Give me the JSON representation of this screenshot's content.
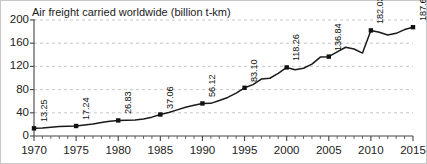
{
  "chart_data": {
    "type": "line",
    "title": "Air freight carried worldwide (billion t-km)",
    "xlabel": "",
    "ylabel": "",
    "xlim": [
      1970,
      2015
    ],
    "ylim": [
      0,
      200
    ],
    "grid": true,
    "legend": null,
    "y_ticks": [
      0,
      40,
      80,
      120,
      160,
      200
    ],
    "x_ticks": [
      1970,
      1975,
      1980,
      1985,
      1990,
      1995,
      2000,
      2005,
      2010,
      2015
    ],
    "x_minor_tick_step": 1,
    "series": [
      {
        "name": "Air freight carried worldwide",
        "color": "#1a1a1a",
        "x": [
          1970,
          1971,
          1972,
          1973,
          1974,
          1975,
          1976,
          1977,
          1978,
          1979,
          1980,
          1981,
          1982,
          1983,
          1984,
          1985,
          1986,
          1987,
          1988,
          1989,
          1990,
          1991,
          1992,
          1993,
          1994,
          1995,
          1996,
          1997,
          1998,
          1999,
          2000,
          2001,
          2002,
          2003,
          2004,
          2005,
          2006,
          2007,
          2008,
          2009,
          2010,
          2011,
          2012,
          2013,
          2014,
          2015
        ],
        "values": [
          13.25,
          13.9,
          15.1,
          16.4,
          16.8,
          17.24,
          19.0,
          20.6,
          23.2,
          25.6,
          26.83,
          27.1,
          27.6,
          29.2,
          32.5,
          37.06,
          40.5,
          45.1,
          49.6,
          53.0,
          56.12,
          56.3,
          61.2,
          66.5,
          74.0,
          83.1,
          88.5,
          98.2,
          99.6,
          108.0,
          118.26,
          114.2,
          116.8,
          124.0,
          136.0,
          136.84,
          145.0,
          153.0,
          150.0,
          143.0,
          182.03,
          179.0,
          174.0,
          177.0,
          183.5,
          187.62
        ]
      }
    ],
    "labeled_points": [
      {
        "x": 1970,
        "y": 13.25,
        "label": "13.25"
      },
      {
        "x": 1975,
        "y": 17.24,
        "label": "17.24"
      },
      {
        "x": 1980,
        "y": 26.83,
        "label": "26.83"
      },
      {
        "x": 1985,
        "y": 37.06,
        "label": "37.06"
      },
      {
        "x": 1990,
        "y": 56.12,
        "label": "56.12"
      },
      {
        "x": 1995,
        "y": 83.1,
        "label": "83.10"
      },
      {
        "x": 2000,
        "y": 118.26,
        "label": "118.26"
      },
      {
        "x": 2005,
        "y": 136.84,
        "label": "136.84"
      },
      {
        "x": 2010,
        "y": 182.03,
        "label": "182.03"
      },
      {
        "x": 2015,
        "y": 187.62,
        "label": "187.62"
      }
    ],
    "colors": {
      "line": "#1a1a1a",
      "marker": "#111111",
      "grid": "#b9b9b9",
      "axis": "#444444",
      "text": "#1a1a1a",
      "background": "#ffffff"
    }
  }
}
